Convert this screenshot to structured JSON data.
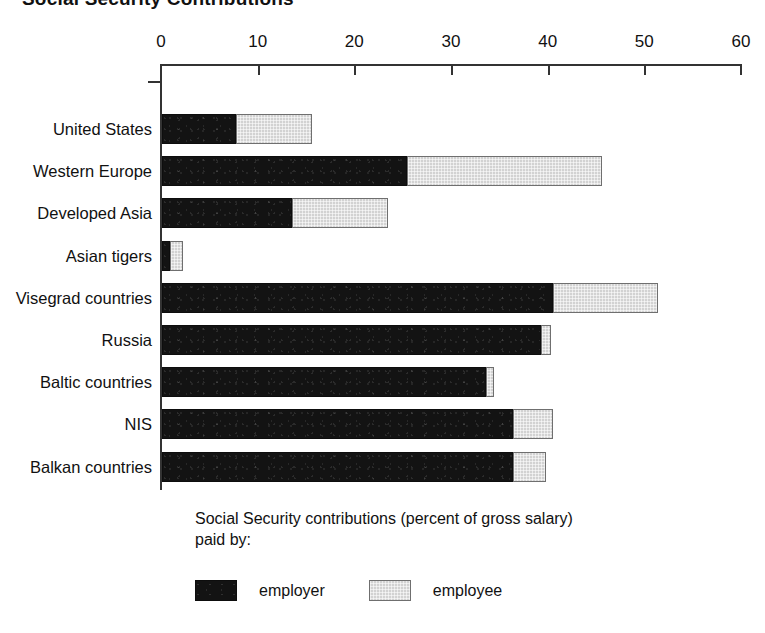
{
  "chart_data": {
    "type": "bar",
    "orientation": "horizontal",
    "stacked": true,
    "title": "Social Security Contributions",
    "xlabel": "",
    "ylabel": "",
    "xlim": [
      0,
      60
    ],
    "xticks": [
      0,
      10,
      20,
      30,
      40,
      50,
      60
    ],
    "xtick_labels": [
      "0",
      "10",
      "20",
      "30",
      "40",
      "50",
      "60"
    ],
    "grid": false,
    "legend_position": "bottom-left",
    "legend_caption": "Social Security contributions (percent of gross salary)\npaid by:",
    "categories": [
      "United States",
      "Western Europe",
      "Developed Asia",
      "Asian tigers",
      "Visegrad countries",
      "Russia",
      "Baltic countries",
      "NIS",
      "Balkan countries"
    ],
    "series": [
      {
        "name": "employer",
        "color": "#131313",
        "values": [
          7.7,
          25.3,
          13.4,
          0.8,
          40.4,
          39.2,
          33.5,
          36.3,
          36.3
        ]
      },
      {
        "name": "employee",
        "color": "#d2d2d2",
        "values": [
          7.8,
          20.2,
          10.0,
          1.4,
          10.9,
          1.0,
          0.8,
          4.1,
          3.4
        ]
      }
    ],
    "totals": [
      15.5,
      45.5,
      23.4,
      2.2,
      51.3,
      40.2,
      34.3,
      40.4,
      39.7
    ]
  },
  "legend": {
    "items": [
      {
        "label": "employer",
        "swatch": "employer"
      },
      {
        "label": "employee",
        "swatch": "employee"
      }
    ]
  }
}
